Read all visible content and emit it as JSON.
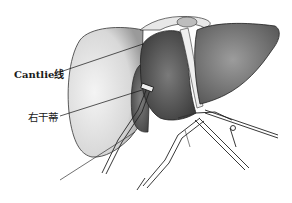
{
  "figure": {
    "labels": [
      {
        "text": "Cantlie线",
        "pointer_from": [
          60,
          72
        ],
        "pointer_to": [
          143,
          44
        ]
      },
      {
        "text": "右干蒂",
        "pointer_from": [
          60,
          116
        ],
        "pointer_to": [
          142,
          90
        ]
      }
    ],
    "colors": {
      "background": "#ffffff",
      "ink": "#1a1a1a",
      "stipple_light": "#d8d8d8",
      "stipple_dark": "#6a6a6a"
    }
  }
}
